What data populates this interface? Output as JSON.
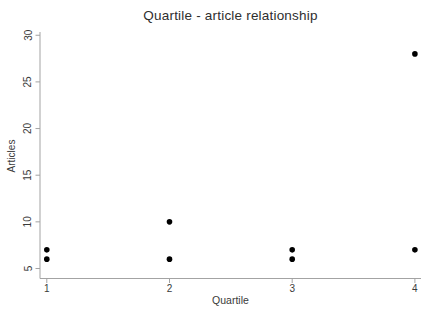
{
  "chart_data": {
    "type": "scatter",
    "title": "Quartile - article relationship",
    "xlabel": "Quartile",
    "ylabel": "Articles",
    "points": [
      {
        "x": 1,
        "y": 6
      },
      {
        "x": 1,
        "y": 7
      },
      {
        "x": 2,
        "y": 6
      },
      {
        "x": 2,
        "y": 10
      },
      {
        "x": 3,
        "y": 6
      },
      {
        "x": 3,
        "y": 7
      },
      {
        "x": 4,
        "y": 7
      },
      {
        "x": 4,
        "y": 28
      }
    ],
    "xticks": [
      1,
      2,
      3,
      4
    ],
    "yticks": [
      5,
      10,
      15,
      20,
      25,
      30
    ],
    "xlim": [
      1,
      4
    ],
    "ylim": [
      5,
      30
    ],
    "grid": false,
    "legend": null,
    "marker_color": "#000000",
    "axis_color": "#a3a3a3",
    "tick_label_color": "#3a3a3a",
    "background_color": "#ffffff",
    "ytick_label_rotation_deg": -90
  }
}
